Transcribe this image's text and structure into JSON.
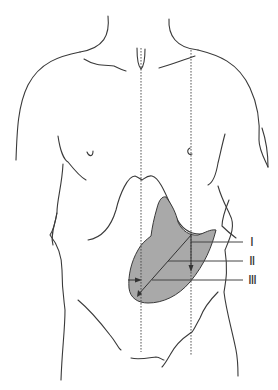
{
  "figure": {
    "type": "anatomical-diagram",
    "labels": [
      {
        "id": "I",
        "text": "Ⅰ"
      },
      {
        "id": "II",
        "text": "Ⅱ"
      },
      {
        "id": "III",
        "text": "Ⅲ"
      }
    ],
    "colors": {
      "outline": "#3a3a3a",
      "shaded_region": "#a9a9a9",
      "background": "#ffffff"
    }
  }
}
